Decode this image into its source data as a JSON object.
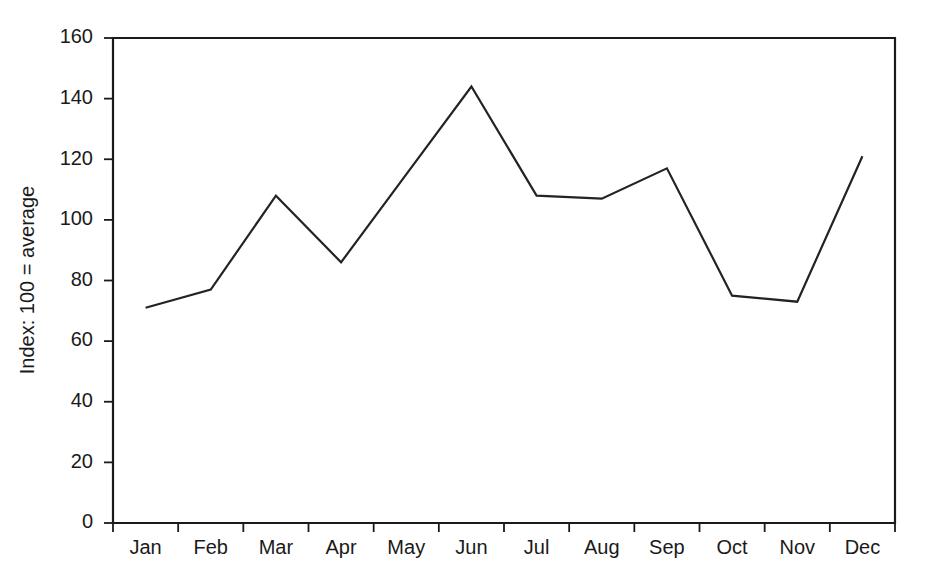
{
  "chart_data": {
    "type": "line",
    "title": "",
    "subtitle": "",
    "xlabel": "",
    "ylabel": "Index: 100 = average",
    "categories": [
      "Jan",
      "Feb",
      "Mar",
      "Apr",
      "May",
      "Jun",
      "Jul",
      "Aug",
      "Sep",
      "Oct",
      "Nov",
      "Dec"
    ],
    "values": [
      71,
      77,
      108,
      86,
      115,
      144,
      108,
      107,
      117,
      75,
      73,
      121
    ],
    "series": [
      {
        "name": "Index",
        "values": [
          71,
          77,
          108,
          86,
          115,
          144,
          108,
          107,
          117,
          75,
          73,
          121
        ]
      }
    ],
    "ylim": [
      0,
      160
    ],
    "ytick_labels": [
      "0",
      "20",
      "40",
      "60",
      "80",
      "100",
      "120",
      "140",
      "160"
    ],
    "ytick_values": [
      0,
      20,
      40,
      60,
      80,
      100,
      120,
      140,
      160
    ],
    "grid": false,
    "legend": false,
    "legend_position": "none",
    "line_color": "#232323",
    "background_color": "#ffffff",
    "axis_color": "#1a1a1a",
    "markers": false,
    "annotations": []
  }
}
